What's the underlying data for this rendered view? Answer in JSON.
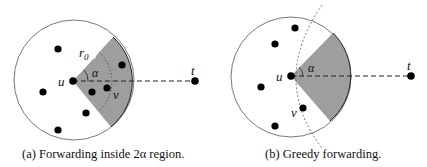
{
  "figures": [
    {
      "id": "a",
      "caption": "(a) Forwarding inside 2α region.",
      "labels": {
        "u": "u",
        "t": "t",
        "r0": "r",
        "r0_sub": "0",
        "alpha": "α",
        "v": "v"
      },
      "center": [
        74,
        80
      ],
      "radius": 60,
      "nodes": [
        [
          58,
          49
        ],
        [
          43,
          92
        ],
        [
          58,
          130
        ],
        [
          86,
          113
        ],
        [
          92,
          92
        ],
        [
          107,
          88
        ],
        [
          122,
          65
        ]
      ],
      "u": [
        73,
        81
      ],
      "t": [
        195,
        81
      ]
    },
    {
      "id": "b",
      "caption": "(b) Greedy forwarding.",
      "labels": {
        "u": "u",
        "t": "t",
        "alpha": "α",
        "v": "v"
      },
      "center": [
        291,
        77
      ],
      "radius": 60,
      "nodes": [
        [
          295,
          28
        ],
        [
          275,
          44
        ],
        [
          261,
          87
        ],
        [
          275,
          126
        ],
        [
          303,
          108
        ]
      ],
      "u": [
        291,
        76
      ],
      "t": [
        411,
        76
      ]
    }
  ],
  "colors": {
    "shade": "#9e9e9e",
    "stroke": "#333333",
    "node": "#000000"
  }
}
